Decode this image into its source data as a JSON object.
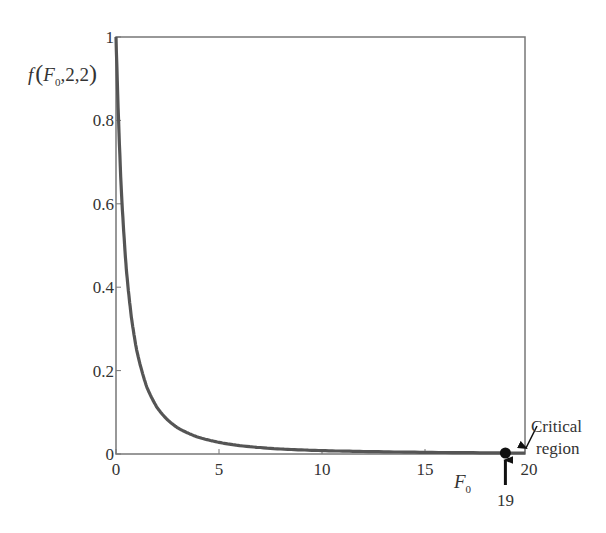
{
  "chart_data": {
    "type": "line",
    "title": "",
    "xlabel": "F",
    "xlabel_sub": "0",
    "ylabel": "f(F0,2,2)",
    "ylabel_parts": {
      "f": "f",
      "open": "(",
      "F": "F",
      "sub": "0",
      "rest": ",2,2",
      "close": ")"
    },
    "xlim": [
      0,
      20
    ],
    "ylim": [
      0,
      1
    ],
    "xticks": [
      0,
      5,
      10,
      15,
      20
    ],
    "xtick_labels": [
      "0",
      "5",
      "10",
      "15",
      "20"
    ],
    "yticks": [
      0,
      0.2,
      0.4,
      0.6,
      0.8,
      1
    ],
    "ytick_labels": [
      "0",
      "0.2",
      "0.4",
      "0.6",
      "0.8",
      "1"
    ],
    "grid": false,
    "series": [
      {
        "name": "F-distribution pdf (2,2)",
        "formula": "1/(1+x)^2",
        "x": [
          0,
          0.25,
          0.5,
          0.75,
          1,
          1.5,
          2,
          2.5,
          3,
          4,
          5,
          6,
          8,
          10,
          12,
          15,
          19
        ],
        "y": [
          1,
          0.64,
          0.444,
          0.327,
          0.25,
          0.16,
          0.111,
          0.082,
          0.0625,
          0.04,
          0.028,
          0.02,
          0.012,
          0.008,
          0.006,
          0.004,
          0.0025
        ],
        "color": "#555555"
      }
    ],
    "annotations": [
      {
        "type": "point",
        "label": "critical-value-point",
        "x": 19,
        "y": 0
      },
      {
        "type": "arrow-text",
        "text": "19",
        "x": 19
      },
      {
        "type": "arrow-text",
        "text_line1": "Critical",
        "text_line2": "region",
        "x": 20
      }
    ]
  }
}
